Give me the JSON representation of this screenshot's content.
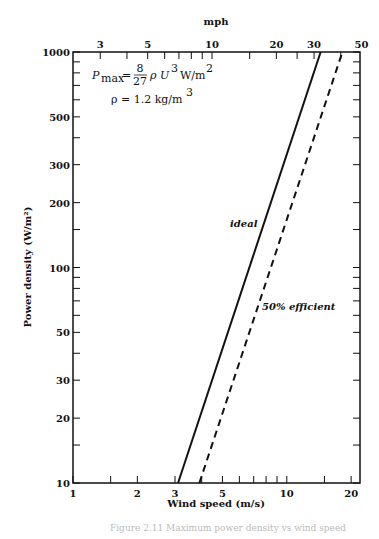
{
  "chart_data": {
    "type": "line",
    "title": "",
    "xlabel": "Wind speed (m/s)",
    "ylabel": "Power density (W/m²)",
    "x2label": "mph",
    "xscale": "log",
    "yscale": "log",
    "xlim": [
      1,
      22
    ],
    "ylim": [
      10,
      1000
    ],
    "grid": false,
    "x_ticks_labeled": [
      "1",
      "2",
      "3",
      "5",
      "10",
      "20"
    ],
    "x_tick_values": [
      1,
      1.5,
      2,
      3,
      4,
      5,
      6,
      7,
      8,
      9,
      10,
      15,
      20
    ],
    "x2_ticks_labeled": [
      "3",
      "5",
      "10",
      "20",
      "30",
      "50"
    ],
    "x2_tick_values_mph": [
      3,
      4,
      5,
      6,
      7,
      8,
      9,
      10,
      15,
      20,
      25,
      30,
      40,
      50
    ],
    "y_ticks_labeled": [
      "10",
      "20",
      "30",
      "50",
      "100",
      "200",
      "300",
      "500",
      "1000"
    ],
    "y_tick_values": [
      10,
      15,
      20,
      30,
      40,
      50,
      60,
      70,
      80,
      90,
      100,
      150,
      200,
      300,
      400,
      500,
      600,
      700,
      800,
      900,
      1000
    ],
    "series": [
      {
        "name": "ideal",
        "style": "solid",
        "x": [
          3.1,
          14.4
        ],
        "y": [
          10,
          1000
        ]
      },
      {
        "name": "50% efficient",
        "style": "dashed",
        "x": [
          3.9,
          18.2
        ],
        "y": [
          10,
          1000
        ]
      }
    ],
    "annotations": [
      {
        "text": "P_max = 8/27 ρ U³ W/m²"
      },
      {
        "text": "ρ = 1.2 kg/m³"
      }
    ]
  },
  "labels": {
    "x_axis_title": "Wind speed (m/s)",
    "y_axis_title": "Power density (W/m²)",
    "top_axis_title": "mph",
    "ideal": "ideal",
    "efficient": "50% efficient",
    "formula_p": "P",
    "formula_sub": "max",
    "formula_eq": "=",
    "formula_num": "8",
    "formula_den": "27",
    "formula_rest": "ρ U",
    "formula_exp": "3",
    "formula_units": "W/m",
    "formula_units_exp": "2",
    "rho_line": "ρ = 1.2 kg/m",
    "rho_exp": "3",
    "caption": "Figure 2.11  Maximum power density vs wind speed"
  }
}
